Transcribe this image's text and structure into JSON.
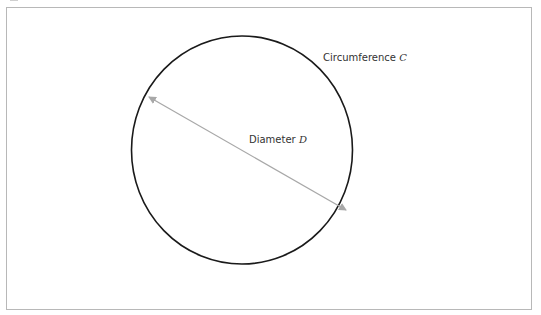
{
  "diagram": {
    "circle": {
      "cx": 242,
      "cy": 150,
      "rx": 110.5,
      "ry": 114,
      "stroke": "#1a1a1a",
      "stroke_width": 1.6
    },
    "diameter_line": {
      "x1": 149,
      "y1": 97,
      "x2": 346,
      "y2": 210,
      "stroke": "#a8a8a8",
      "arrowheads": "both"
    },
    "labels": {
      "circumference": {
        "text": "Circumference",
        "variable": "C"
      },
      "diameter": {
        "text": "Diameter",
        "variable": "D"
      }
    },
    "frame_border_color": "#b8b8b8"
  }
}
